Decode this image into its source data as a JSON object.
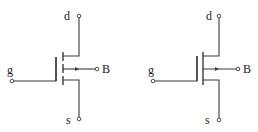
{
  "diagram": {
    "type": "circuit-symbols",
    "colors": {
      "line": "#3a3a3a",
      "text": "#222222",
      "background": "#ffffff"
    },
    "symbols": [
      {
        "id": "left",
        "channel": "broken (enhancement-mode)",
        "labels": {
          "drain": "d",
          "gate": "g",
          "source": "s",
          "body": "B"
        }
      },
      {
        "id": "right",
        "channel": "continuous (depletion-mode)",
        "labels": {
          "drain": "d",
          "gate": "g",
          "source": "s",
          "body": "B"
        }
      }
    ]
  }
}
